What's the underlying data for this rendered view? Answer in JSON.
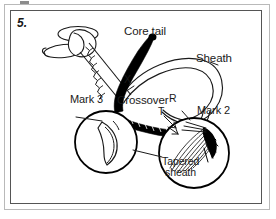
{
  "figure": {
    "step_number": "5.",
    "title_labels": {
      "core_tail": "Core tail",
      "sheath": "Sheath",
      "crossover": "Crossover",
      "mark_3": "Mark 3",
      "mark_2": "Mark 2",
      "tapered_sheath_line1": "Tapered",
      "tapered_sheath_line2": "sheath"
    },
    "point_markers": {
      "x": "X",
      "r": "R",
      "t": "T"
    },
    "colors": {
      "ink": "#1a1a1a",
      "core_fill": "#000000",
      "paper": "#ffffff",
      "outer_frame": "#b9b9b9",
      "inner_frame": "#555555"
    }
  }
}
